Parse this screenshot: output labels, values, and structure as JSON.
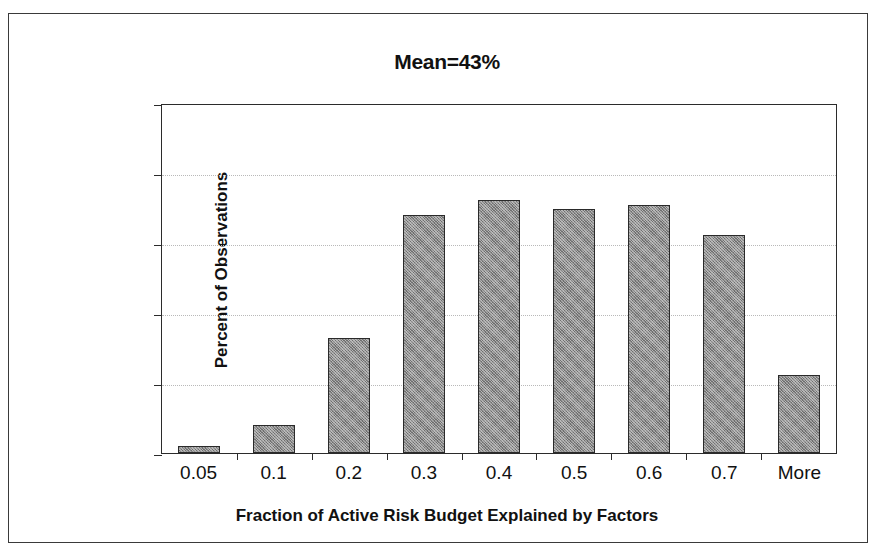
{
  "chart_data": {
    "type": "bar",
    "title": "Mean=43%",
    "xlabel": "Fraction of Active Risk Budget Explained by Factors",
    "ylabel": "Percent of Observations",
    "categories": [
      "0.05",
      "0.1",
      "0.2",
      "0.3",
      "0.4",
      "0.5",
      "0.6",
      "0.7",
      "More"
    ],
    "values": [
      0.5,
      2.0,
      8.2,
      17.0,
      18.1,
      17.4,
      17.7,
      15.6,
      5.6
    ],
    "ylim": [
      0,
      25
    ],
    "ytick_values": [
      0,
      5,
      10,
      15,
      20,
      25
    ],
    "ytick_labels": [
      "0%",
      "5%",
      "10%",
      "15%",
      "20%",
      "25%"
    ],
    "grid": true,
    "legend": "none",
    "bar_color": "#8a8a8a",
    "bar_border_color": "#2a2a2a",
    "gridline_color": "#b9b9b9",
    "axis_color": "#2b2b2b",
    "annotations": [
      "Mean=43%"
    ]
  }
}
